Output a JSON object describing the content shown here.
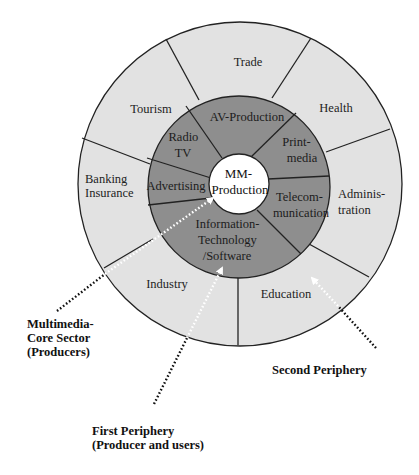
{
  "diagram": {
    "center": {
      "label_line1": "MM-",
      "label_line2": "Production"
    },
    "inner_ring": {
      "name": "Multimedia core sector",
      "segments": [
        {
          "id": "av",
          "lines": [
            "AV-Production"
          ]
        },
        {
          "id": "print",
          "lines": [
            "Print-",
            "media"
          ]
        },
        {
          "id": "telecom",
          "lines": [
            "Telecom-",
            "munication"
          ]
        },
        {
          "id": "it",
          "lines": [
            "Information-",
            "Technology",
            "/Software"
          ]
        },
        {
          "id": "advertising",
          "lines": [
            "Advertising"
          ]
        },
        {
          "id": "radio",
          "lines": [
            "Radio",
            "TV"
          ]
        }
      ]
    },
    "outer_ring": {
      "name": "Second periphery",
      "segments": [
        {
          "id": "trade",
          "lines": [
            "Trade"
          ]
        },
        {
          "id": "health",
          "lines": [
            "Health"
          ]
        },
        {
          "id": "administration",
          "lines": [
            "Adminis-",
            "tration"
          ]
        },
        {
          "id": "education",
          "lines": [
            "Education"
          ]
        },
        {
          "id": "industry",
          "lines": [
            "Industry"
          ]
        },
        {
          "id": "banking",
          "lines": [
            "Banking",
            "Insurance"
          ]
        },
        {
          "id": "tourism",
          "lines": [
            "Tourism"
          ]
        }
      ]
    },
    "callouts": [
      {
        "id": "core",
        "lines": [
          "Multimedia-",
          "Core Sector",
          "(Producers)"
        ]
      },
      {
        "id": "first",
        "lines": [
          "First Periphery",
          "(Producer and users)"
        ]
      },
      {
        "id": "second",
        "lines": [
          "Second Periphery"
        ]
      }
    ],
    "colors": {
      "outer_fill": "#e2e2e2",
      "inner_fill": "#8e8e8e",
      "center_fill": "#ffffff",
      "stroke": "#222222"
    }
  }
}
